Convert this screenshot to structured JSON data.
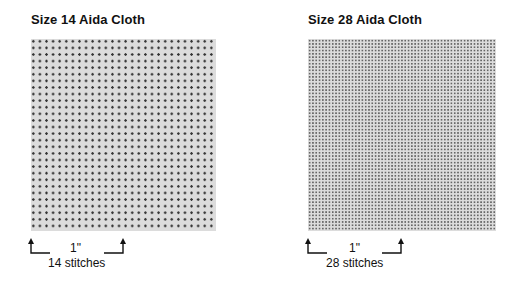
{
  "left_panel": {
    "title": "Size 14 Aida Cloth",
    "measure": "1\"",
    "count_label": "14 stitches",
    "stitches_per_inch": 14
  },
  "right_panel": {
    "title": "Size 28 Aida Cloth",
    "measure": "1\"",
    "count_label": "28 stitches",
    "stitches_per_inch": 28
  }
}
